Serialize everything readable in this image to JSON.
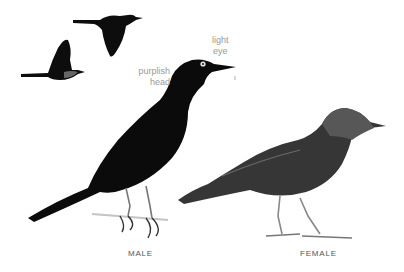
{
  "illustration": {
    "subject": "blackbird",
    "annotations": {
      "eye_line1": "light",
      "eye_line2": "eye",
      "head_line1": "purplish",
      "head_line2": "head"
    },
    "captions": {
      "male": "MALE",
      "female": "FEMALE"
    },
    "colors": {
      "male_body": "#0b0b0b",
      "female_body": "#3a3a3a",
      "female_head": "#5a5a5a",
      "label_text": "#9a9a9a",
      "caption_text": "#555555",
      "background": "#ffffff"
    }
  }
}
